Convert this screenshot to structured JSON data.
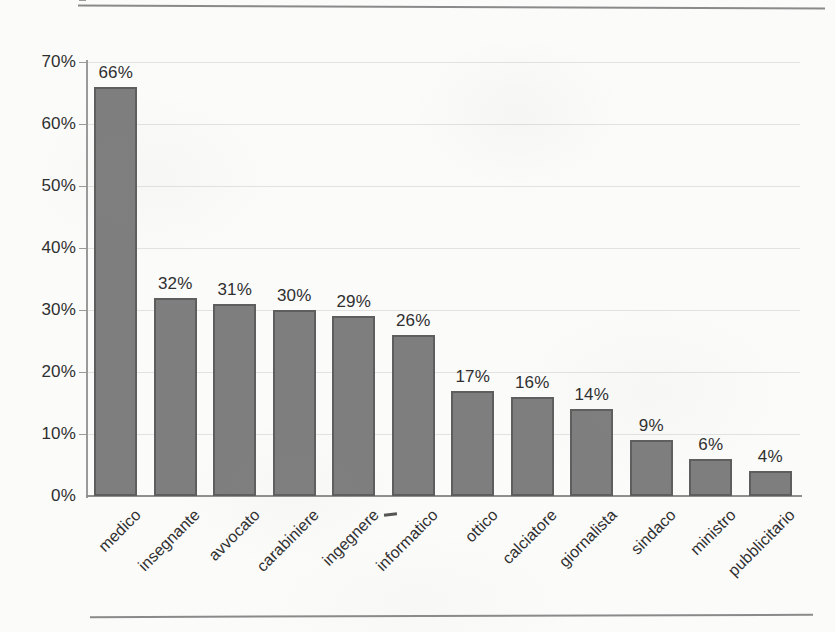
{
  "chart_data": {
    "type": "bar",
    "title": "",
    "subtitle": "",
    "xlabel": "",
    "ylabel": "",
    "categories": [
      "medico",
      "insegnante",
      "avvocato",
      "carabiniere",
      "ingegnere",
      "informatico",
      "ottico",
      "calciatore",
      "giornalista",
      "sindaco",
      "ministro",
      "pubblicitario"
    ],
    "values": [
      66,
      32,
      31,
      30,
      29,
      26,
      17,
      16,
      14,
      9,
      6,
      4
    ],
    "value_labels": [
      "66%",
      "32%",
      "31%",
      "30%",
      "29%",
      "26%",
      "17%",
      "16%",
      "14%",
      "9%",
      "6%",
      "4%"
    ],
    "ylim": [
      0,
      70
    ],
    "ytick_values": [
      0,
      10,
      20,
      30,
      40,
      50,
      60,
      70
    ],
    "ytick_labels": [
      "0%",
      "10%",
      "20%",
      "30%",
      "40%",
      "50%",
      "60%",
      "70%"
    ],
    "grid": true,
    "grid_axis": "y",
    "legend": false,
    "legend_position": "none",
    "bar_color": "#7e7e7e",
    "bar_border_color": "#5e5e5e",
    "gridline_color": "#e2e2e2",
    "axis_color": "#8f8f8f",
    "text_color": "#2f2f2f",
    "background_color": "#fbfbfa",
    "xtick_label_rotation": -45
  },
  "page": {
    "rule_color": "#8a8a8a"
  }
}
